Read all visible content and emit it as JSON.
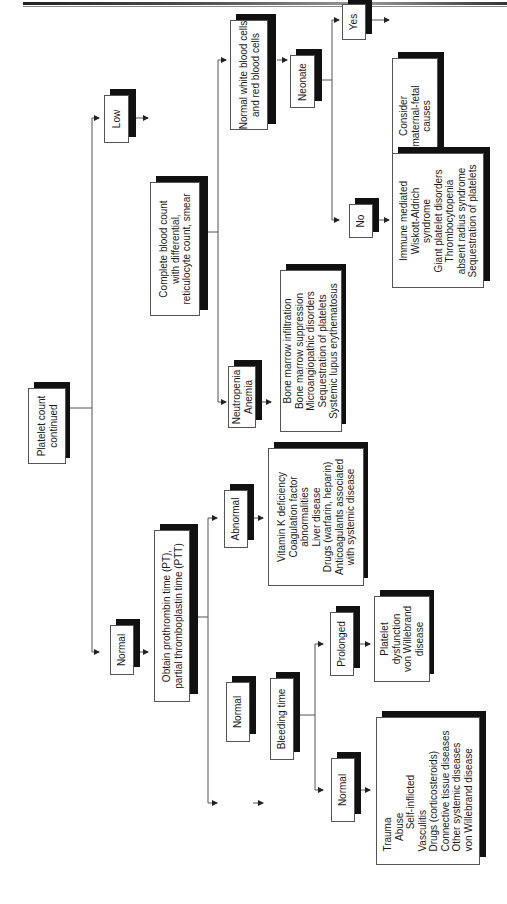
{
  "page": {
    "rule_color": "#222222",
    "box_shadow_color": "#111111",
    "line_color": "#555555"
  },
  "nodes": {
    "root": "Platelet count\ncontinued",
    "normal": "Normal",
    "low": "Low",
    "pt_ptt": "Obtain prothrombin time (PT),\npartial thromboplastin time (PTT)",
    "cbc": "Complete blood count\nwith differential,\nreticulocyte count, smear",
    "abnormal": "Abnormal",
    "abnormal_causes": "Vitamin K deficiency\nCoagulation factor\nabnormalities\nLiver disease\nDrugs (warfarin, heparin)\nAnticoagulants associated\nwith systemic disease",
    "normal_pt": "Normal",
    "bleeding_time": "Bleeding time",
    "prolonged": "Prolonged",
    "prolonged_causes": "Platelet\ndysfunction\nvon Willebrand\ndisease",
    "normal_bt": "Normal",
    "normal_bt_causes": "Trauma\n    Abuse\n        Self-inflicted\nVasculitis\nDrugs (corticosteroids)\nConnective tissue diseases\nOther systemic diseases\nvon Willebrand disease",
    "neutropenia": "Neutropenia\nAnemia",
    "neutropenia_causes": "Bone marrow infiltration\nBone marrow suppression\nMicroangiopathic disorders\nSequestration of platelets\nSystemic lupus erythematosus",
    "normal_cells": "Normal white blood cells\nand red blood cells",
    "neonate": "Neonate",
    "yes": "Yes",
    "yes_causes": "Consider\nmaternal-fetal\ncauses",
    "no": "No",
    "no_causes": "Immune mediated\nWiskott-Aldrich\nsyndrome\nGiant platelet disorders\nThrombocytopenia\nabsent radius syndrome\nSequestration of platelets"
  }
}
